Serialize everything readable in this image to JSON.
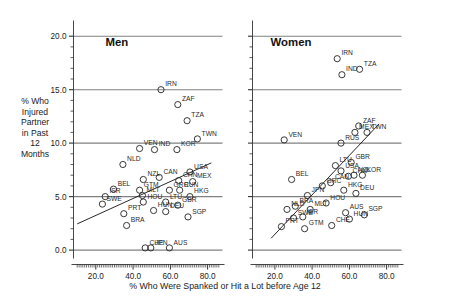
{
  "axes": {
    "ylabel_lines": [
      "% Who",
      "Injured",
      "Partner",
      "in Past",
      "12",
      "Months"
    ],
    "ylabel": "% Who Injured Partner in Past 12 Months",
    "xlabel": "% Who Were Spanked or Hit a Lot before Age 12",
    "yticks": [
      "0.0",
      "5.0",
      "10.0",
      "15.0",
      "20.0"
    ],
    "xticks": [
      "20.0",
      "40.0",
      "60.0",
      "80.0"
    ]
  },
  "panels": [
    {
      "title": "Men"
    },
    {
      "title": "Women"
    }
  ],
  "chart_data": {
    "type": "scatter",
    "title": "",
    "xlabel": "% Who Were Spanked or Hit a Lot before Age 12",
    "ylabel": "% Who Injured Partner in Past 12 Months",
    "xlim": [
      8.0,
      88.0
    ],
    "ylim": [
      -0.6,
      21.0
    ],
    "xticks": [
      20.0,
      40.0,
      60.0,
      80.0
    ],
    "yticks": [
      0.0,
      5.0,
      10.0,
      15.0,
      20.0
    ],
    "grid": "horizontal-major",
    "legend": "none",
    "panels": [
      {
        "name": "Men",
        "fit_line": {
          "x": [
            10.0,
            82.0
          ],
          "y": [
            2.45,
            8.15
          ]
        },
        "points": [
          {
            "label": "IRN",
            "x": 55.0,
            "y": 15.0
          },
          {
            "label": "ZAF",
            "x": 64.0,
            "y": 13.6
          },
          {
            "label": "TZA",
            "x": 69.0,
            "y": 12.1
          },
          {
            "label": "TWN",
            "x": 74.5,
            "y": 10.4
          },
          {
            "label": "VEN",
            "x": 43.5,
            "y": 9.5
          },
          {
            "label": "IND",
            "x": 51.5,
            "y": 9.4
          },
          {
            "label": "KOR",
            "x": 63.5,
            "y": 9.4
          },
          {
            "label": "NLD",
            "x": 34.5,
            "y": 8.0
          },
          {
            "label": "USA",
            "x": 70.5,
            "y": 7.3
          },
          {
            "label": "NZL",
            "x": 45.5,
            "y": 6.6
          },
          {
            "label": "CAN",
            "x": 54.0,
            "y": 6.8
          },
          {
            "label": "CHN",
            "x": 64.5,
            "y": 6.5
          },
          {
            "label": "MEX",
            "x": 72.0,
            "y": 6.4
          },
          {
            "label": "BEL",
            "x": 29.5,
            "y": 5.7
          },
          {
            "label": "GTM",
            "x": 43.5,
            "y": 5.6
          },
          {
            "label": "GRC",
            "x": 59.5,
            "y": 5.6
          },
          {
            "label": "RUN",
            "x": 65.0,
            "y": 5.6
          },
          {
            "label": "MLT",
            "x": 45.0,
            "y": 5.1
          },
          {
            "label": "ISR",
            "x": 25.0,
            "y": 5.0
          },
          {
            "label": "HKG",
            "x": 70.5,
            "y": 5.0
          },
          {
            "label": "HOU",
            "x": 45.5,
            "y": 4.5
          },
          {
            "label": "LTU",
            "x": 57.5,
            "y": 4.5
          },
          {
            "label": "SWE",
            "x": 23.5,
            "y": 4.3
          },
          {
            "label": "GBR",
            "x": 64.0,
            "y": 4.2
          },
          {
            "label": "HUN",
            "x": 51.0,
            "y": 3.7
          },
          {
            "label": "DEU",
            "x": 57.5,
            "y": 3.6
          },
          {
            "label": "PRT",
            "x": 35.0,
            "y": 3.4
          },
          {
            "label": "SGP",
            "x": 69.5,
            "y": 3.1
          },
          {
            "label": "BRA",
            "x": 36.5,
            "y": 2.3
          },
          {
            "label": "CHE",
            "x": 46.5,
            "y": 0.2
          },
          {
            "label": "JPN",
            "x": 49.5,
            "y": 0.2
          },
          {
            "label": "AUS",
            "x": 59.5,
            "y": 0.2
          }
        ]
      },
      {
        "name": "Women",
        "fit_line": {
          "x": [
            18.0,
            76.0
          ],
          "y": [
            1.1,
            11.8
          ]
        },
        "points": [
          {
            "label": "IRN",
            "x": 53.5,
            "y": 17.9
          },
          {
            "label": "TZA",
            "x": 65.5,
            "y": 16.9
          },
          {
            "label": "IND",
            "x": 56.0,
            "y": 16.4
          },
          {
            "label": "ZAF",
            "x": 65.0,
            "y": 11.6
          },
          {
            "label": "MEX",
            "x": 63.0,
            "y": 11.0
          },
          {
            "label": "TWN",
            "x": 69.5,
            "y": 11.0
          },
          {
            "label": "VEN",
            "x": 25.0,
            "y": 10.3
          },
          {
            "label": "RUS",
            "x": 55.5,
            "y": 10.0
          },
          {
            "label": "GBR",
            "x": 61.0,
            "y": 8.2
          },
          {
            "label": "LTU",
            "x": 52.5,
            "y": 7.9
          },
          {
            "label": "USA",
            "x": 55.5,
            "y": 7.4
          },
          {
            "label": "NZL",
            "x": 62.5,
            "y": 7.0
          },
          {
            "label": "KOR",
            "x": 67.0,
            "y": 7.0
          },
          {
            "label": "CHN",
            "x": 59.5,
            "y": 6.9
          },
          {
            "label": "BEL",
            "x": 29.0,
            "y": 6.6
          },
          {
            "label": "CAN",
            "x": 50.0,
            "y": 6.3
          },
          {
            "label": "GRC",
            "x": 45.5,
            "y": 6.0
          },
          {
            "label": "HKG",
            "x": 57.0,
            "y": 5.6
          },
          {
            "label": "DEU",
            "x": 63.5,
            "y": 5.3
          },
          {
            "label": "JPN",
            "x": 37.5,
            "y": 5.1
          },
          {
            "label": "HOU",
            "x": 47.5,
            "y": 4.4
          },
          {
            "label": "BRA",
            "x": 31.0,
            "y": 4.1
          },
          {
            "label": "NLD",
            "x": 26.5,
            "y": 3.8
          },
          {
            "label": "MLT",
            "x": 39.0,
            "y": 3.8
          },
          {
            "label": "AUS",
            "x": 58.0,
            "y": 3.5
          },
          {
            "label": "SGP",
            "x": 68.0,
            "y": 3.3
          },
          {
            "label": "ISR",
            "x": 35.0,
            "y": 3.1
          },
          {
            "label": "SWE",
            "x": 30.0,
            "y": 3.0
          },
          {
            "label": "HUN",
            "x": 60.0,
            "y": 2.9
          },
          {
            "label": "CHE",
            "x": 50.5,
            "y": 2.3
          },
          {
            "label": "PRT",
            "x": 23.5,
            "y": 2.2
          },
          {
            "label": "GTM",
            "x": 36.0,
            "y": 2.0
          }
        ]
      }
    ]
  }
}
